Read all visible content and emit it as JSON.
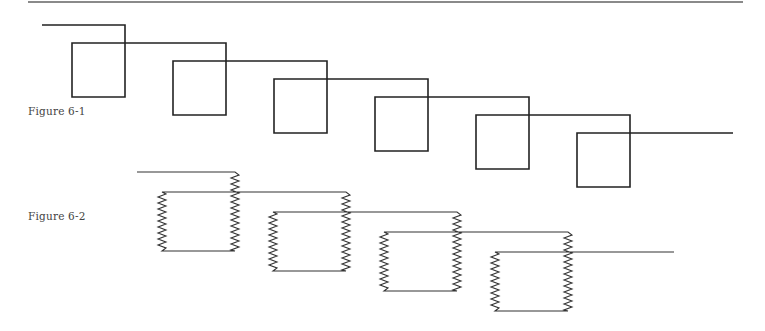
{
  "figures": [
    {
      "label": "Figure 6-1",
      "style": "square-loops",
      "stroke_color": "#222222",
      "start": [
        42,
        25
      ],
      "loop_width": 53,
      "loop_height": 72,
      "loop_overlap": 19,
      "step": [
        101,
        18
      ],
      "loops": 6,
      "end_x": 733
    },
    {
      "label": "Figure 6-2",
      "style": "spring-loops",
      "stroke_color": "#333333",
      "start": [
        137,
        172
      ],
      "loop_width": 73,
      "loop_height": 79,
      "loop_overlap": 19,
      "step": [
        111,
        20
      ],
      "loops": 4,
      "end_x": 674,
      "spring_amplitude": 8,
      "spring_pitch": 3
    }
  ],
  "colors": {
    "rule": "#8a8a8a",
    "label": "#444444"
  }
}
